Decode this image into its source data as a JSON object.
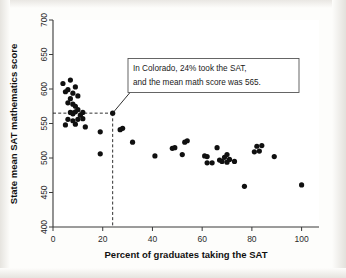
{
  "figure": {
    "name": "sat-scatterplot",
    "background_color": "#fdfdfb",
    "point_color": "#101010",
    "axis_color": "#3a3a3a",
    "annotation_border_color": "#555555"
  },
  "annotation": {
    "line1": "In Colorado, 24% took the SAT,",
    "line2": "and the mean math score was 565.",
    "target_x": 24,
    "target_y": 565
  },
  "chart_data": {
    "type": "scatter",
    "title": "",
    "xlabel": "Percent of graduates taking the SAT",
    "ylabel": "State mean SAT mathematics score",
    "xlim": [
      0,
      107
    ],
    "ylim": [
      400,
      700
    ],
    "xticks": [
      0,
      20,
      40,
      60,
      80,
      100
    ],
    "yticks": [
      400,
      450,
      500,
      550,
      600,
      650,
      700
    ],
    "xtick_labels": [
      "0",
      "20",
      "40",
      "60",
      "80",
      "100"
    ],
    "ytick_labels": [
      "400",
      "450",
      "500",
      "550",
      "600",
      "650",
      "700"
    ],
    "grid": false,
    "legend": null,
    "marker": "filled-circle",
    "marker_size": 3,
    "points": [
      [
        4,
        608
      ],
      [
        5,
        596
      ],
      [
        6,
        599
      ],
      [
        7,
        613
      ],
      [
        8,
        594
      ],
      [
        7,
        586
      ],
      [
        9,
        603
      ],
      [
        10,
        590
      ],
      [
        6,
        580
      ],
      [
        8,
        578
      ],
      [
        9,
        575
      ],
      [
        7,
        566
      ],
      [
        8,
        565
      ],
      [
        8,
        564
      ],
      [
        9,
        567
      ],
      [
        10,
        570
      ],
      [
        11,
        562
      ],
      [
        12,
        566
      ],
      [
        6,
        556
      ],
      [
        8,
        554
      ],
      [
        10,
        556
      ],
      [
        12,
        557
      ],
      [
        5,
        548
      ],
      [
        9,
        549
      ],
      [
        13,
        545
      ],
      [
        19,
        538
      ],
      [
        19,
        506
      ],
      [
        24,
        565
      ],
      [
        27,
        541
      ],
      [
        28,
        543
      ],
      [
        32,
        523
      ],
      [
        41,
        503
      ],
      [
        48,
        514
      ],
      [
        49,
        515
      ],
      [
        52,
        505
      ],
      [
        53,
        523
      ],
      [
        54,
        525
      ],
      [
        61,
        503
      ],
      [
        62,
        502
      ],
      [
        62,
        493
      ],
      [
        64,
        493
      ],
      [
        66,
        515
      ],
      [
        67,
        497
      ],
      [
        68,
        495
      ],
      [
        69,
        501
      ],
      [
        70,
        505
      ],
      [
        70,
        494
      ],
      [
        71,
        498
      ],
      [
        73,
        495
      ],
      [
        77,
        459
      ],
      [
        81,
        509
      ],
      [
        82,
        517
      ],
      [
        83,
        510
      ],
      [
        84,
        518
      ],
      [
        89,
        502
      ],
      [
        100,
        461
      ]
    ],
    "annotations": [
      {
        "text": "In Colorado, 24% took the SAT, and the mean math score was 565.",
        "points_to": [
          24,
          565
        ],
        "dashed_guides": true
      }
    ]
  }
}
